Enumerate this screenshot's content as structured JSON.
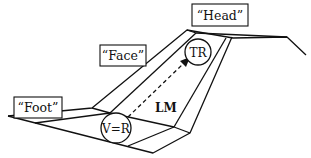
{
  "diagram": {
    "labels": {
      "head": "“Head”",
      "face": "“Face”",
      "foot": "“Foot”"
    },
    "circles": {
      "top": "TR",
      "bottom": "V=R"
    },
    "arrow_label": "LM",
    "colors": {
      "line": "#111111",
      "background": "#ffffff"
    }
  }
}
